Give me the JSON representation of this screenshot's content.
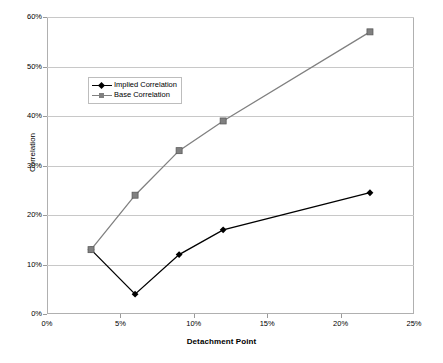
{
  "chart_data": {
    "type": "line",
    "title": "",
    "xlabel": "Detachment Point",
    "ylabel": "Correlation",
    "xlim": [
      0,
      25
    ],
    "ylim": [
      0,
      60
    ],
    "xtick_labels": [
      "0%",
      "5%",
      "10%",
      "15%",
      "20%",
      "25%"
    ],
    "xticks": [
      0,
      5,
      10,
      15,
      20,
      25
    ],
    "ytick_labels": [
      "0%",
      "10%",
      "20%",
      "30%",
      "40%",
      "50%",
      "60%"
    ],
    "yticks": [
      0,
      10,
      20,
      30,
      40,
      50,
      60
    ],
    "grid": "horizontal",
    "legend_position": "upper-left-inside",
    "series": [
      {
        "name": "Implied Correlation",
        "color": "#000000",
        "marker": "diamond",
        "x": [
          3,
          6,
          9,
          12,
          22
        ],
        "values": [
          13,
          4,
          12,
          17,
          24.5
        ]
      },
      {
        "name": "Base Correlation",
        "color": "#808080",
        "marker": "square",
        "x": [
          3,
          6,
          9,
          12,
          22
        ],
        "values": [
          13,
          24,
          33,
          39,
          57
        ]
      }
    ]
  },
  "axes": {
    "y_title": "Correlation",
    "x_title": "Detachment Point",
    "y_labels": [
      "60%",
      "50%",
      "40%",
      "30%",
      "20%",
      "10%",
      "0%"
    ],
    "x_labels": [
      "0%",
      "5%",
      "10%",
      "15%",
      "20%",
      "25%"
    ]
  },
  "legend": {
    "items": [
      {
        "label": "Implied Correlation",
        "color": "#000000",
        "marker": "diamond-marker"
      },
      {
        "label": "Base Correlation",
        "color": "#808080",
        "marker": "square-marker"
      }
    ]
  },
  "fragments": {
    "top": "",
    "bottom": ""
  }
}
